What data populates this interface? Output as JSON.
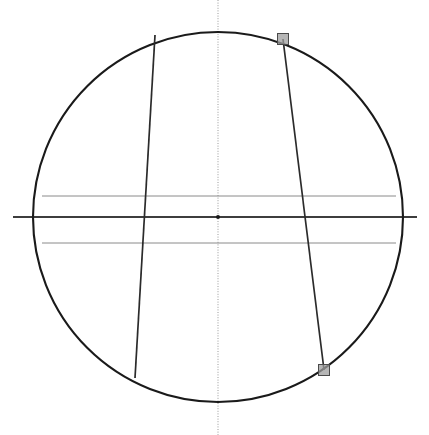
{
  "view": {
    "title": "Circle Sketch View",
    "width": 429,
    "height": 435,
    "background_color": "#ffffff"
  },
  "colors": {
    "outline": "#1a1a1a",
    "chord": "#2b2b2b",
    "centerline_horizontal": "#3d3d3d",
    "centerline_vertical": "#9a9a9a",
    "construction_line": "#8a8a8a",
    "handle_fill": "#9e9e9e",
    "handle_stroke": "#4a4a4a",
    "center_point": "#1a1a1a"
  },
  "geometry": {
    "circle": {
      "label": "circle-outline",
      "cx": 218,
      "cy": 217,
      "r": 185,
      "stroke_width": 2.1
    },
    "center_point": {
      "label": "center-point",
      "cx": 218,
      "cy": 217,
      "r": 2.0
    },
    "axis_vertical": {
      "label": "vertical-centerline",
      "x": 218,
      "y1": 0,
      "y2": 435,
      "stroke_width": 1
    },
    "axis_horizontal": {
      "label": "horizontal-centerline",
      "y": 217,
      "x1": 13,
      "x2": 417,
      "stroke_width": 2
    },
    "construction_lines": [
      {
        "label": "upper-construction-line",
        "y": 196,
        "x1": 42,
        "x2": 396,
        "stroke_width": 1
      },
      {
        "label": "lower-construction-line",
        "y": 243,
        "x1": 42,
        "x2": 396,
        "stroke_width": 1
      }
    ],
    "chords": [
      {
        "label": "left-chord",
        "x1": 155,
        "y1": 35,
        "x2": 135,
        "y2": 378,
        "stroke_width": 1.7
      },
      {
        "label": "right-chord",
        "x1": 283,
        "y1": 39,
        "x2": 324,
        "y2": 370,
        "stroke_width": 1.7
      }
    ],
    "handles": [
      {
        "label": "top-right-handle",
        "cx": 283,
        "cy": 39,
        "size": 11
      },
      {
        "label": "bottom-right-handle",
        "cx": 324,
        "cy": 370,
        "size": 11
      }
    ]
  }
}
